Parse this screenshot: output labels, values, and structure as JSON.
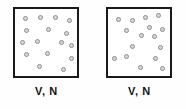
{
  "figure": {
    "type": "diagram",
    "background_color": "#fefefe"
  },
  "style": {
    "box_border_color": "#1a1a1a",
    "box_fill_color": "#ffffff",
    "particle_fill_color": "#d8d8d8",
    "particle_border_color": "#8d8d8d",
    "label_color": "#141414"
  },
  "panels": [
    {
      "id": "left-container",
      "label": "V, N",
      "particle_count": 16,
      "particles": [
        {
          "x": 8,
          "y": 7
        },
        {
          "x": 23,
          "y": 6
        },
        {
          "x": 38,
          "y": 6
        },
        {
          "x": 52,
          "y": 9
        },
        {
          "x": 9,
          "y": 19
        },
        {
          "x": 31,
          "y": 18
        },
        {
          "x": 49,
          "y": 22
        },
        {
          "x": 5,
          "y": 31
        },
        {
          "x": 20,
          "y": 30
        },
        {
          "x": 44,
          "y": 31
        },
        {
          "x": 54,
          "y": 34
        },
        {
          "x": 9,
          "y": 43
        },
        {
          "x": 30,
          "y": 42
        },
        {
          "x": 54,
          "y": 47
        },
        {
          "x": 22,
          "y": 55
        },
        {
          "x": 46,
          "y": 58
        }
      ]
    },
    {
      "id": "right-container",
      "label": "V, N",
      "particle_count": 16,
      "particles": [
        {
          "x": 8,
          "y": 8
        },
        {
          "x": 22,
          "y": 9
        },
        {
          "x": 35,
          "y": 6
        },
        {
          "x": 48,
          "y": 4
        },
        {
          "x": 16,
          "y": 19
        },
        {
          "x": 39,
          "y": 16
        },
        {
          "x": 52,
          "y": 18
        },
        {
          "x": 31,
          "y": 24
        },
        {
          "x": 44,
          "y": 25
        },
        {
          "x": 22,
          "y": 35
        },
        {
          "x": 50,
          "y": 36
        },
        {
          "x": 4,
          "y": 47
        },
        {
          "x": 16,
          "y": 45
        },
        {
          "x": 45,
          "y": 47
        },
        {
          "x": 30,
          "y": 56
        },
        {
          "x": 52,
          "y": 57
        }
      ]
    }
  ]
}
